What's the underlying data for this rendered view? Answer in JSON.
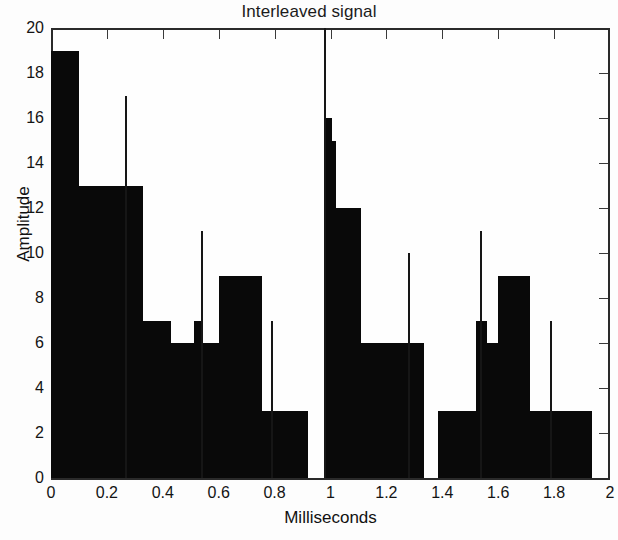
{
  "chart": {
    "title": "Interleaved signal",
    "xlabel": "Milliseconds",
    "ylabel": "Amplitude"
  },
  "axes": {
    "x_ticks": [
      "0",
      "0.2",
      "0.4",
      "0.6",
      "0.8",
      "1",
      "1.2",
      "1.4",
      "1.6",
      "1.8",
      "2"
    ],
    "y_ticks": [
      "0",
      "2",
      "4",
      "6",
      "8",
      "10",
      "12",
      "14",
      "16",
      "18",
      "20"
    ]
  },
  "chart_data": {
    "type": "bar",
    "title": "Interleaved signal",
    "xlabel": "Milliseconds",
    "ylabel": "Amplitude",
    "xlim": [
      0,
      2
    ],
    "ylim": [
      0,
      20
    ],
    "xtick_step": 0.2,
    "ytick_step": 2,
    "grid": false,
    "legend": null,
    "bin_width": 0.1,
    "categories": [
      "0.0-0.1",
      "0.1-0.2",
      "0.2-0.3",
      "0.3-0.4",
      "0.4-0.5",
      "0.5-0.6",
      "0.6-0.7",
      "0.7-0.8",
      "0.8-0.9",
      "0.9-1.0",
      "1.0-1.1",
      "1.1-1.2",
      "1.2-1.3",
      "1.3-1.4",
      "1.4-1.5",
      "1.5-1.6",
      "1.6-1.7",
      "1.7-1.8",
      "1.8-1.9",
      "1.9-2.0"
    ],
    "bars": [
      {
        "x0": 0.0,
        "x1": 0.1,
        "value": 19
      },
      {
        "x0": 0.1,
        "x1": 0.33,
        "value": 13
      },
      {
        "x0": 0.33,
        "x1": 0.43,
        "value": 7
      },
      {
        "x0": 0.43,
        "x1": 0.51,
        "value": 6
      },
      {
        "x0": 0.51,
        "x1": 0.545,
        "value": 7
      },
      {
        "x0": 0.545,
        "x1": 0.6,
        "value": 6
      },
      {
        "x0": 0.6,
        "x1": 0.755,
        "value": 9
      },
      {
        "x0": 0.755,
        "x1": 0.92,
        "value": 3
      },
      {
        "x0": 0.92,
        "x1": 0.975,
        "value": 0
      },
      {
        "x0": 0.975,
        "x1": 1.005,
        "value": 16
      },
      {
        "x0": 1.005,
        "x1": 1.02,
        "value": 15
      },
      {
        "x0": 1.02,
        "x1": 1.11,
        "value": 12
      },
      {
        "x0": 1.11,
        "x1": 1.335,
        "value": 6
      },
      {
        "x0": 1.335,
        "x1": 1.385,
        "value": 0
      },
      {
        "x0": 1.385,
        "x1": 1.52,
        "value": 3
      },
      {
        "x0": 1.52,
        "x1": 1.56,
        "value": 7
      },
      {
        "x0": 1.56,
        "x1": 1.6,
        "value": 6
      },
      {
        "x0": 1.6,
        "x1": 1.715,
        "value": 9
      },
      {
        "x0": 1.715,
        "x1": 1.935,
        "value": 3
      },
      {
        "x0": 1.935,
        "x1": 2.0,
        "value": 0
      }
    ],
    "spikes": [
      {
        "x": 0.27,
        "value": 17
      },
      {
        "x": 0.54,
        "value": 11
      },
      {
        "x": 0.79,
        "value": 7
      },
      {
        "x": 0.98,
        "value": 20
      },
      {
        "x": 1.28,
        "value": 10
      },
      {
        "x": 1.54,
        "value": 11
      },
      {
        "x": 1.79,
        "value": 7
      }
    ]
  },
  "colors": {
    "bar": "#090909",
    "axis": "#2a2a2a",
    "background": "#fefefe",
    "text": "#141414"
  }
}
